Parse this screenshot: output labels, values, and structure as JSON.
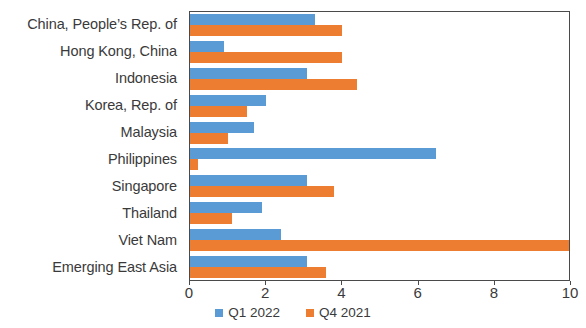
{
  "chart_data": {
    "type": "bar",
    "orientation": "horizontal",
    "title": "",
    "subtitle": "",
    "xlabel": "",
    "ylabel": "",
    "xlim": [
      0,
      10
    ],
    "ylim": null,
    "xticks": [
      0,
      2,
      4,
      6,
      8,
      10
    ],
    "xtick_labels": [
      "0",
      "2",
      "4",
      "6",
      "8",
      "10"
    ],
    "grid": false,
    "legend_position": "bottom-center",
    "categories": [
      "China, People’s Rep. of",
      "Hong Kong, China",
      "Indonesia",
      "Korea, Rep. of",
      "Malaysia",
      "Philippines",
      "Singapore",
      "Thailand",
      "Viet Nam",
      "Emerging East Asia"
    ],
    "series": [
      {
        "name": "Q1 2022",
        "color": "#5b9bd5",
        "values": [
          3.3,
          0.9,
          3.1,
          2.0,
          1.7,
          6.5,
          3.1,
          1.9,
          2.4,
          3.1
        ]
      },
      {
        "name": "Q4 2021",
        "color": "#ed7d31",
        "values": [
          4.0,
          4.0,
          4.4,
          1.5,
          1.0,
          0.2,
          3.8,
          1.1,
          10.0,
          3.6
        ]
      }
    ]
  },
  "legend": {
    "items": [
      {
        "label": "Q1 2022",
        "swatch": "legend-swatch-blue"
      },
      {
        "label": "Q4 2021",
        "swatch": "legend-swatch-orange"
      }
    ]
  },
  "colors": {
    "series_q1_2022": "#5b9bd5",
    "series_q4_2021": "#ed7d31",
    "axis": "#4a4a4a",
    "text": "#3a3a3a",
    "background": "#ffffff"
  }
}
